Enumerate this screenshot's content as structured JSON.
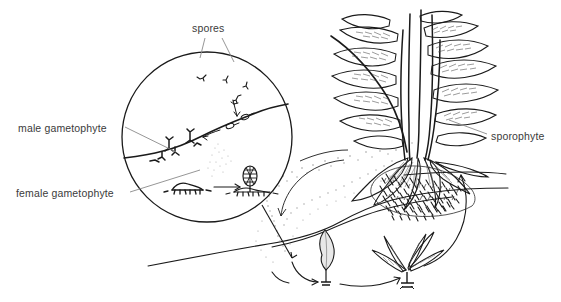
{
  "figure": {
    "background_color": "#ffffff",
    "ink_color": "#1a1a1a",
    "label_color": "#3b3b3b",
    "leader_color": "#7a7a7a"
  },
  "labels": {
    "spores": "spores",
    "male_gametophyte": "male gametophyte",
    "female_gametophyte": "female gametophyte",
    "sporophyte": "sporophyte"
  },
  "inset": {
    "name": "magnified-circle-inset",
    "center_x": 207,
    "center_y": 137,
    "radius": 85,
    "contents": [
      "spores",
      "male gametophyte (antheridial prothallus)",
      "female gametophyte (archegonial prothallus)",
      "young sporophyte on prothallus",
      "soil surface line"
    ]
  },
  "scene": {
    "sporophyte_plant": "mature fern frond cluster with pinnate leaves",
    "rhizome_mass": "dense dark root / rhizome mound",
    "ground_lines": 3,
    "spore_cloud": "stippled dispersing spores",
    "young_plants": [
      "heart-shaped prothallus",
      "juvenile sporophyte seedling"
    ],
    "cycle_arrows": 4
  }
}
